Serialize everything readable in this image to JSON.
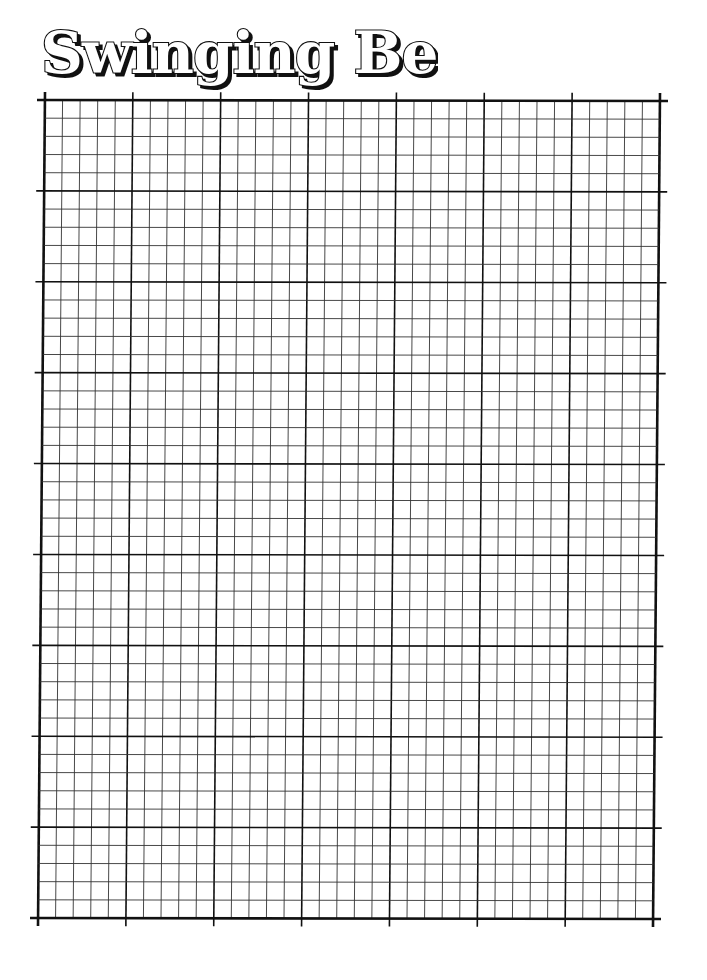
{
  "title": {
    "text": "Swinging Bears"
  },
  "grid": {
    "columns": 35,
    "rows": 45,
    "major_every": 5,
    "top_left": [
      45,
      100
    ],
    "top_right": [
      660,
      101
    ],
    "bottom_left": [
      38,
      918
    ],
    "bottom_right": [
      653,
      919
    ],
    "minor_color": "#333333",
    "major_color": "#111111"
  }
}
